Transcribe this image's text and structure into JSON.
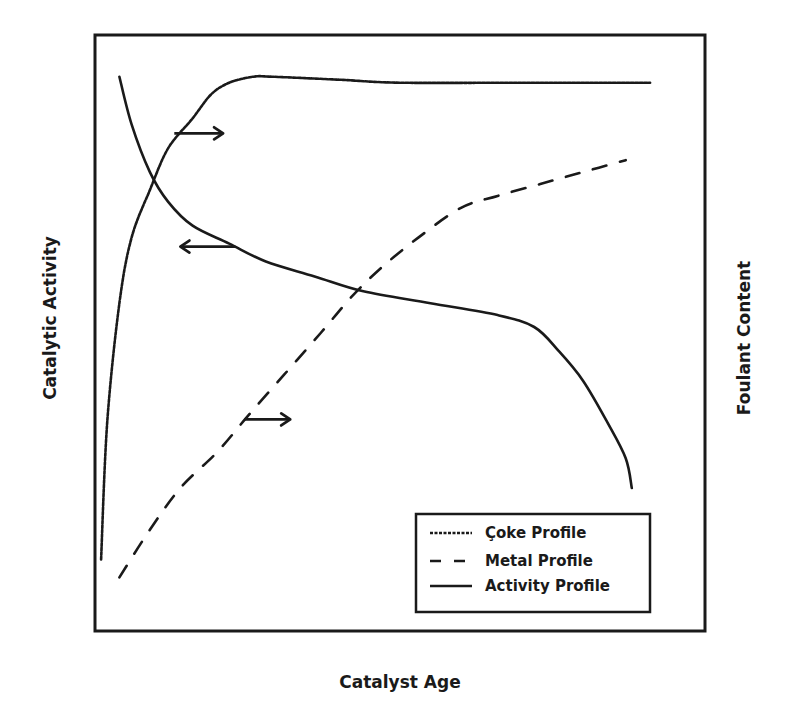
{
  "chart_data": {
    "type": "line",
    "title": "",
    "xlabel": "Catalyst Age",
    "ylabel_left": "Catalytic Activity",
    "ylabel_right": "Foulant Content",
    "xlim": [
      0,
      1
    ],
    "ylim": [
      0,
      1
    ],
    "units_note": "qualitative (no tick marks); values normalized 0-1",
    "grid": false,
    "legend_position": "bottom-right",
    "series": [
      {
        "name": "Coke Profile",
        "axis": "right",
        "style": "dotted",
        "x": [
          0.01,
          0.02,
          0.04,
          0.06,
          0.09,
          0.12,
          0.16,
          0.19,
          0.22,
          0.26,
          0.29,
          0.4,
          0.5,
          0.7,
          0.91
        ],
        "y": [
          0.12,
          0.35,
          0.55,
          0.66,
          0.74,
          0.81,
          0.86,
          0.9,
          0.92,
          0.93,
          0.93,
          0.925,
          0.92,
          0.92,
          0.92
        ]
      },
      {
        "name": "Metal Profile",
        "axis": "right",
        "style": "dashed",
        "x": [
          0.04,
          0.09,
          0.14,
          0.2,
          0.25,
          0.31,
          0.37,
          0.42,
          0.47,
          0.53,
          0.6,
          0.66,
          0.73,
          0.8,
          0.87
        ],
        "y": [
          0.09,
          0.17,
          0.24,
          0.3,
          0.36,
          0.43,
          0.5,
          0.56,
          0.61,
          0.66,
          0.71,
          0.73,
          0.75,
          0.77,
          0.79
        ]
      },
      {
        "name": "Activity Profile",
        "axis": "left",
        "style": "solid",
        "x": [
          0.04,
          0.06,
          0.09,
          0.12,
          0.16,
          0.22,
          0.28,
          0.36,
          0.44,
          0.55,
          0.66,
          0.72,
          0.76,
          0.8,
          0.84,
          0.87,
          0.88
        ],
        "y": [
          0.93,
          0.85,
          0.77,
          0.72,
          0.68,
          0.65,
          0.62,
          0.595,
          0.57,
          0.55,
          0.53,
          0.51,
          0.47,
          0.42,
          0.35,
          0.29,
          0.24
        ]
      }
    ],
    "annotations": [
      {
        "type": "arrow",
        "direction": "right",
        "refers_to": "Coke Profile",
        "meaning": "read on right axis",
        "from": [
          0.13,
          0.835
        ],
        "to": [
          0.21,
          0.835
        ]
      },
      {
        "type": "arrow",
        "direction": "left",
        "refers_to": "Activity Profile",
        "meaning": "read on left axis",
        "from": [
          0.23,
          0.645
        ],
        "to": [
          0.14,
          0.645
        ]
      },
      {
        "type": "arrow",
        "direction": "right",
        "refers_to": "Metal Profile",
        "meaning": "read on right axis",
        "from": [
          0.245,
          0.355
        ],
        "to": [
          0.32,
          0.355
        ]
      }
    ]
  },
  "legend": {
    "items": [
      {
        "label": "Çoke Profile",
        "style": "dotted"
      },
      {
        "label": "Metal Profile",
        "style": "dashed"
      },
      {
        "label": "Activity Profile",
        "style": "solid"
      }
    ]
  },
  "colors": {
    "ink": "#1a1a1a",
    "background": "#ffffff"
  }
}
